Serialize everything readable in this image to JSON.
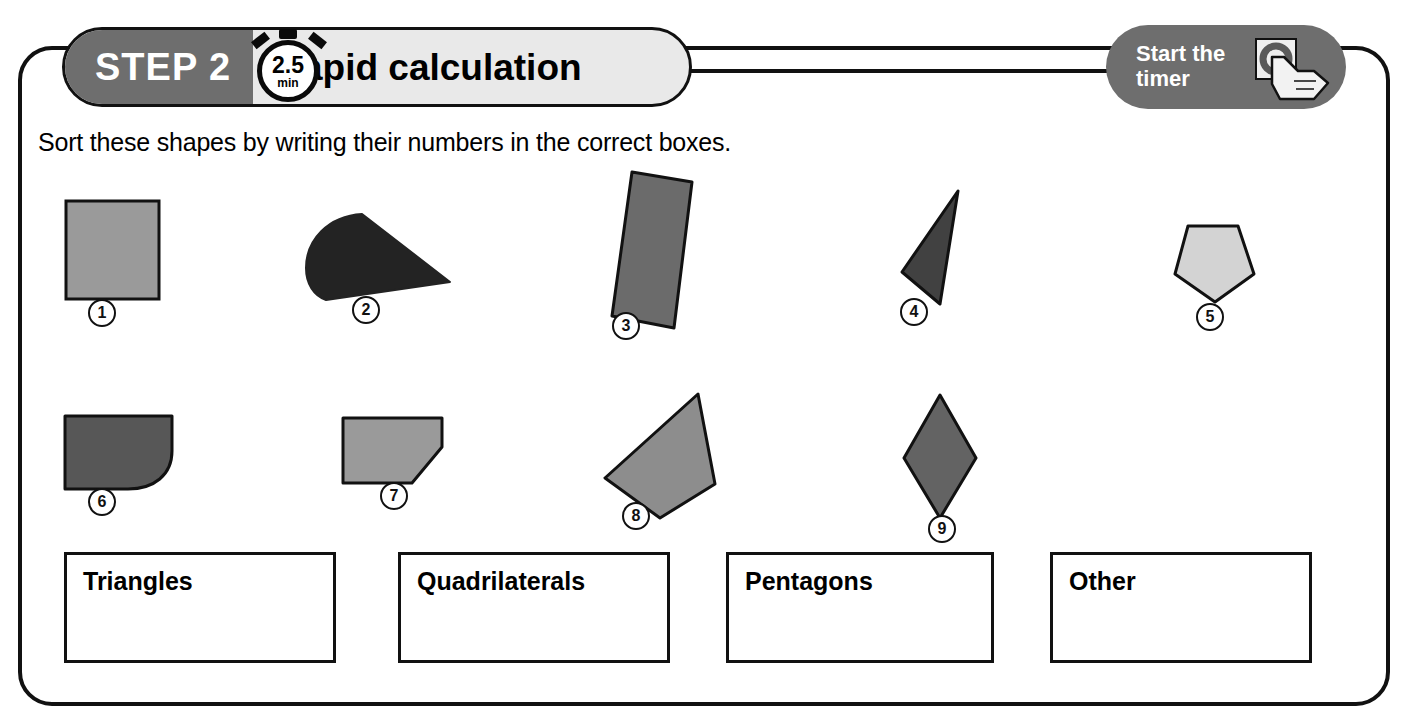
{
  "header": {
    "step_label": "STEP 2",
    "title": "Rapid calculation",
    "timer": {
      "value": "2.5",
      "unit": "min",
      "icon": "stopwatch-icon"
    },
    "start_button": {
      "label": "Start the\ntimer",
      "line1": "Start the",
      "line2": "timer",
      "icon": "hand-pointer-icon"
    }
  },
  "instruction": "Sort these shapes by writing their numbers in the correct boxes.",
  "shapes": [
    {
      "number": "1",
      "name": "square",
      "fill": "#9a9a9a",
      "stroke": "#111"
    },
    {
      "number": "2",
      "name": "wedge-semicircle",
      "fill": "#232323",
      "stroke": "#232323"
    },
    {
      "number": "3",
      "name": "tilted-rectangle",
      "fill": "#6b6b6b",
      "stroke": "#111"
    },
    {
      "number": "4",
      "name": "narrow-triangle",
      "fill": "#414141",
      "stroke": "#111"
    },
    {
      "number": "5",
      "name": "pentagon",
      "fill": "#d3d3d3",
      "stroke": "#111"
    },
    {
      "number": "6",
      "name": "rounded-corner-shape",
      "fill": "#575757",
      "stroke": "#111"
    },
    {
      "number": "7",
      "name": "cut-corner-pentagon",
      "fill": "#9a9a9a",
      "stroke": "#111"
    },
    {
      "number": "8",
      "name": "irregular-quadrilateral",
      "fill": "#8d8d8d",
      "stroke": "#111"
    },
    {
      "number": "9",
      "name": "rhombus",
      "fill": "#636363",
      "stroke": "#111"
    }
  ],
  "answer_boxes": [
    {
      "label": "Triangles"
    },
    {
      "label": "Quadrilaterals"
    },
    {
      "label": "Pentagons"
    },
    {
      "label": "Other"
    }
  ],
  "colors": {
    "banner_left": "#6e6e6e",
    "banner_right": "#e9e9e9",
    "button": "#6e6e6e",
    "ink": "#111111"
  }
}
